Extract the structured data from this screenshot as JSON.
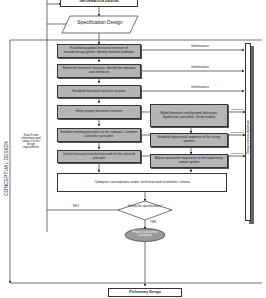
{
  "header": {
    "information_design": "INFORMATION DESIGN",
    "specification_design": "Specification Design"
  },
  "phase_label": "CONCEPTUAL DESIGN",
  "feedback_note": "Search new information and adapt it to the design requirements",
  "database_label": "Design process database",
  "left_column": [
    "Establishing global functional structure of manufacturing system, identify essential problems",
    "Refine the functional structure, identify the subtasks and interfaces",
    "Establish functional structure variants",
    "Select proper functional structure",
    "Establish working principles for the subtasks. Combine and select principles",
    "Derive functional structure focused on the selected principle"
  ],
  "right_column": [
    "Model kinematic and dynamic behaviour. Synthesize controllers. Verify models",
    "Establish operational sequence of the acting systems",
    "Adjust operational sequences to the supervisory control system"
  ],
  "information_labels": [
    "Informations",
    "Informations",
    "Informations"
  ],
  "small_information_labels": [
    "Informations",
    "Informations",
    "Informations"
  ],
  "compare_box": "Compare conceptions under technical and economic criteria",
  "decision": "Satisfy the specifications?",
  "no_label": "NO",
  "yes_label": "YES",
  "ellipse": "Physical and control conception",
  "preliminary": "Preliminary Design",
  "colors": {
    "box_fill": "#b5b5b5",
    "line": "#333333",
    "background": "#ffffff"
  }
}
